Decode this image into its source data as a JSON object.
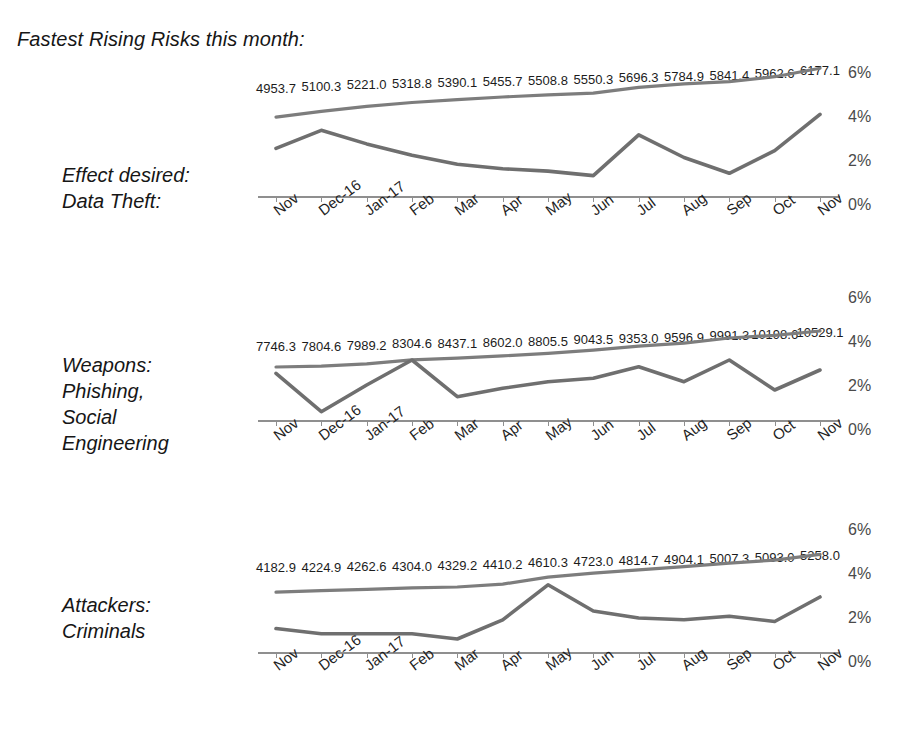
{
  "title": "Fastest Rising Risks this month:",
  "rows": [
    {
      "label": "Effect desired:\nData Theft:"
    },
    {
      "label": "Weapons:\nPhishing,\nSocial\nEngineering"
    },
    {
      "label": "Attackers:\nCriminals"
    }
  ],
  "axis": {
    "categories": [
      "Nov",
      "Dec-16",
      "Jan-17",
      "Feb",
      "Mar",
      "Apr",
      "May",
      "Jun",
      "Jul",
      "Aug",
      "Sep",
      "Oct",
      "Nov"
    ],
    "yticks": [
      "6%",
      "4%",
      "2%",
      "0%"
    ]
  },
  "colors": {
    "line_volume": "#7d7d7d",
    "line_percent": "#6f6f6f",
    "axis": "#8f8f8f",
    "text": "#161616",
    "background": "#ffffff"
  },
  "chart_data": [
    {
      "type": "line",
      "title": "Effect desired: Data Theft:",
      "xlabel": "",
      "ylabel": "",
      "ylim": [
        0,
        6
      ],
      "grid": false,
      "legend": "none",
      "x": [
        "Nov",
        "Dec-16",
        "Jan-17",
        "Feb",
        "Mar",
        "Apr",
        "May",
        "Jun",
        "Jul",
        "Aug",
        "Sep",
        "Oct",
        "Nov"
      ],
      "yticks": [
        0,
        2,
        4,
        6
      ],
      "ytick_labels": [
        "0%",
        "2%",
        "4%",
        "6%"
      ],
      "series": [
        {
          "name": "Volume",
          "kind": "labeled-volume",
          "data_labels": [
            "4953.7",
            "5100.3",
            "5221.0",
            "5318.8",
            "5390.1",
            "5455.7",
            "5508.8",
            "5550.3",
            "5696.3",
            "5784.9",
            "5841.4",
            "5962.6",
            "6177.1"
          ],
          "values": [
            4953.7,
            5100.3,
            5221.0,
            5318.8,
            5390.1,
            5455.7,
            5508.8,
            5550.3,
            5696.3,
            5784.9,
            5841.4,
            5962.6,
            6177.1
          ]
        },
        {
          "name": "Percent growth",
          "kind": "percent",
          "values": [
            2.1,
            2.9,
            2.3,
            1.8,
            1.4,
            1.2,
            1.1,
            0.9,
            2.7,
            1.7,
            1.0,
            2.0,
            3.6
          ]
        }
      ]
    },
    {
      "type": "line",
      "title": "Weapons: Phishing, Social Engineering",
      "xlabel": "",
      "ylabel": "",
      "ylim": [
        0,
        6
      ],
      "grid": false,
      "legend": "none",
      "x": [
        "Nov",
        "Dec-16",
        "Jan-17",
        "Feb",
        "Mar",
        "Apr",
        "May",
        "Jun",
        "Jul",
        "Aug",
        "Sep",
        "Oct",
        "Nov"
      ],
      "yticks": [
        0,
        2,
        4,
        6
      ],
      "ytick_labels": [
        "0%",
        "2%",
        "4%",
        "6%"
      ],
      "series": [
        {
          "name": "Volume",
          "kind": "labeled-volume",
          "data_labels": [
            "7746.3",
            "7804.6",
            "7989.2",
            "8304.6",
            "8437.1",
            "8602.0",
            "8805.5",
            "9043.5",
            "9353.0",
            "9596.9",
            "9991.3",
            "10198.6",
            "10529.1"
          ],
          "values": [
            7746.3,
            7804.6,
            7989.2,
            8304.6,
            8437.1,
            8602.0,
            8805.5,
            9043.5,
            9353.0,
            9596.9,
            9991.3,
            10198.6,
            10529.1
          ]
        },
        {
          "name": "Percent growth",
          "kind": "percent",
          "values": [
            3.1,
            0.8,
            2.4,
            3.9,
            1.7,
            2.2,
            2.6,
            2.8,
            3.5,
            2.6,
            3.9,
            2.1,
            3.3
          ]
        }
      ]
    },
    {
      "type": "line",
      "title": "Attackers: Criminals",
      "xlabel": "",
      "ylabel": "",
      "ylim": [
        0,
        6
      ],
      "grid": false,
      "legend": "none",
      "x": [
        "Nov",
        "Dec-16",
        "Jan-17",
        "Feb",
        "Mar",
        "Apr",
        "May",
        "Jun",
        "Jul",
        "Aug",
        "Sep",
        "Oct",
        "Nov"
      ],
      "yticks": [
        0,
        2,
        4,
        6
      ],
      "ytick_labels": [
        "0%",
        "2%",
        "4%",
        "6%"
      ],
      "series": [
        {
          "name": "Volume",
          "kind": "labeled-volume",
          "data_labels": [
            "4182.9",
            "4224.9",
            "4262.6",
            "4304.0",
            "4329.2",
            "4410.2",
            "4610.3",
            "4723.0",
            "4814.7",
            "4904.1",
            "5007.3",
            "5093.0",
            "5258.0"
          ],
          "values": [
            4182.9,
            4224.9,
            4262.6,
            4304.0,
            4329.2,
            4410.2,
            4610.3,
            4723.0,
            4814.7,
            4904.1,
            5007.3,
            5093.0,
            5258.0
          ]
        },
        {
          "name": "Percent growth",
          "kind": "percent",
          "values": [
            1.4,
            1.1,
            1.1,
            1.1,
            0.8,
            1.9,
            3.9,
            2.4,
            2.0,
            1.9,
            2.1,
            1.8,
            3.2
          ]
        }
      ]
    }
  ]
}
